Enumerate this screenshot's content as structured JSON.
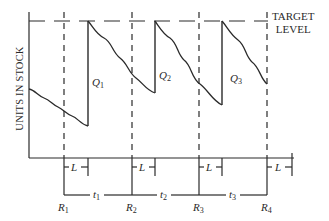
{
  "diagram": {
    "y_axis_label": "UNITS IN STOCK",
    "target_label_line1": "TARGET",
    "target_label_line2": "LEVEL",
    "order_quantities": [
      {
        "letter": "Q",
        "sub": "1"
      },
      {
        "letter": "Q",
        "sub": "2"
      },
      {
        "letter": "Q",
        "sub": "3"
      }
    ],
    "review_points": [
      {
        "letter": "R",
        "sub": "1"
      },
      {
        "letter": "R",
        "sub": "2"
      },
      {
        "letter": "R",
        "sub": "3"
      },
      {
        "letter": "R",
        "sub": "4"
      }
    ],
    "intervals": [
      {
        "letter": "t",
        "sub": "1"
      },
      {
        "letter": "t",
        "sub": "2"
      },
      {
        "letter": "t",
        "sub": "3"
      }
    ],
    "lead_time_label": "L",
    "colors": {
      "line": "#2a2a2a",
      "background": "#ffffff"
    }
  }
}
